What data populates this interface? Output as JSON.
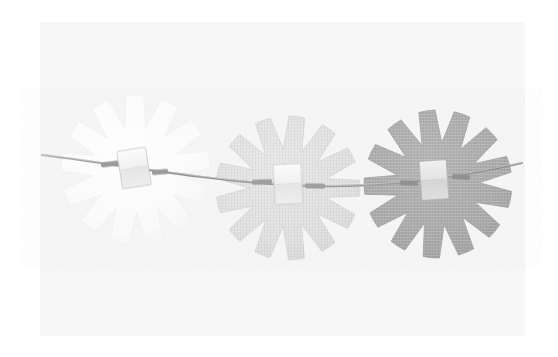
{
  "figure": {
    "title": "Three notched discs threaded on a wire",
    "media_type": "scanned-photograph",
    "width": 558,
    "height": 357
  },
  "canvas": {
    "outer_background": "#ffffff",
    "panel": {
      "x": 40,
      "y": 22,
      "width": 485,
      "height": 314,
      "fill": "#f6f6f6"
    }
  },
  "colors": {
    "outer_background": "#ffffff",
    "panel_background": "#f6f6f6",
    "disc_light": "#fcfcfc",
    "disc_light_edge": "#f0f0f0",
    "disc_mid": "#e0e0e0",
    "disc_dark": "#a9a9a9",
    "wire": "#8d8d8d",
    "wire_highlight": "#c9c9c9",
    "block_fill": "#f2f2f2",
    "block_edge": "#c2c2c2",
    "ferrule": "#9a9a9a"
  },
  "discs": [
    {
      "name": "disc-left",
      "label": "Left disc (lightest)",
      "cx": 136,
      "cy": 170,
      "radius": 75,
      "notch_count": 13,
      "notch_depth": 0.42,
      "notch_angular_width": 7,
      "rotation": 6,
      "fill": "#fcfcfc",
      "stroke": "#f1f1f1",
      "tone": "white"
    },
    {
      "name": "disc-middle",
      "label": "Middle disc (light gray)",
      "cx": 288,
      "cy": 188,
      "radius": 72,
      "notch_count": 13,
      "notch_depth": 0.46,
      "notch_angular_width": 7.5,
      "rotation": 14,
      "fill": "#e0e0e0",
      "stroke": "#d6d6d6",
      "tone": "light-gray"
    },
    {
      "name": "disc-right",
      "label": "Right disc (medium gray)",
      "cx": 438,
      "cy": 184,
      "radius": 74,
      "notch_count": 13,
      "notch_depth": 0.44,
      "notch_angular_width": 7.5,
      "rotation": 26,
      "fill": "#a9a9a9",
      "stroke": "#9f9f9f",
      "tone": "medium-gray"
    }
  ],
  "wire": {
    "name": "mounting-wire",
    "label": "Thin mounting wire",
    "path": "M 42,155 C 110,163 200,180 288,185 C 370,190 455,178 522,163",
    "stroke": "#8d8d8d",
    "stroke_width": 2.1,
    "highlight_stroke": "#cfcfcf",
    "highlight_width": 0.9,
    "left_end_x": 42,
    "left_end_y": 155,
    "right_end_x": 522,
    "right_end_y": 163
  },
  "blocks": [
    {
      "name": "clamp-block-left",
      "label": "Clamp block on left disc",
      "cx": 134,
      "cy": 168,
      "width": 29,
      "height": 38,
      "rotation": -9,
      "fill": "#f4f4f4",
      "stroke": "#c9c9c9"
    },
    {
      "name": "clamp-block-middle",
      "label": "Clamp block on middle disc",
      "cx": 288,
      "cy": 184,
      "width": 28,
      "height": 40,
      "rotation": -3,
      "fill": "#f7f7f7",
      "stroke": "#cccccc"
    },
    {
      "name": "clamp-block-right",
      "label": "Clamp block on right disc",
      "cx": 434,
      "cy": 180,
      "width": 27,
      "height": 39,
      "rotation": -4,
      "fill": "#e9e9e9",
      "stroke": "#b6b6b6"
    }
  ],
  "ferrules": [
    {
      "name": "ferrule-left-a",
      "cx": 110,
      "cy": 164,
      "width": 18,
      "height": 5,
      "rotation": -7,
      "fill": "#9a9a9a"
    },
    {
      "name": "ferrule-left-b",
      "cx": 160,
      "cy": 172,
      "width": 16,
      "height": 5,
      "rotation": -5,
      "fill": "#9a9a9a"
    },
    {
      "name": "ferrule-mid-a",
      "cx": 262,
      "cy": 182,
      "width": 20,
      "height": 5,
      "rotation": -2,
      "fill": "#9e9e9e"
    },
    {
      "name": "ferrule-mid-b",
      "cx": 315,
      "cy": 186,
      "width": 20,
      "height": 5,
      "rotation": 1,
      "fill": "#9e9e9e"
    },
    {
      "name": "ferrule-right-a",
      "cx": 409,
      "cy": 183,
      "width": 18,
      "height": 5,
      "rotation": 2,
      "fill": "#8f8f8f"
    },
    {
      "name": "ferrule-right-b",
      "cx": 461,
      "cy": 177,
      "width": 18,
      "height": 5,
      "rotation": 4,
      "fill": "#8f8f8f"
    }
  ]
}
